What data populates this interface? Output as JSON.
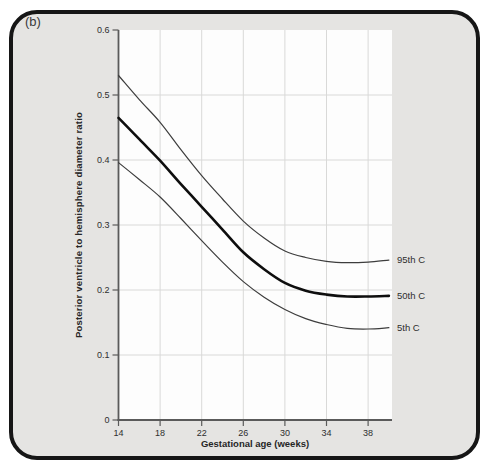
{
  "figure_label": "(b)",
  "colors": {
    "card_background": "#e5e4e2",
    "card_border": "#161616",
    "plot_background": "#fdfdfd",
    "gridline": "#d9d9d8",
    "axis": "#5a5a5a",
    "curve_thin": "#3d3d3d",
    "curve_thick": "#0e0e0e",
    "text": "#2e2e2e"
  },
  "chart_data": {
    "type": "line",
    "title": "",
    "xlabel": "Gestational age (weeks)",
    "ylabel": "Posterior ventricle to hemisphere diameter ratio",
    "xlim": [
      14,
      40.3
    ],
    "ylim": [
      0,
      0.6
    ],
    "xticks": [
      14,
      18,
      22,
      26,
      30,
      34,
      38
    ],
    "yticks": [
      0,
      0.1,
      0.2,
      0.3,
      0.4,
      0.5,
      0.6
    ],
    "grid": true,
    "legend_position": "labels-right-of-curves",
    "x": [
      14,
      16,
      18,
      20,
      22,
      24,
      26,
      28,
      30,
      32,
      34,
      36,
      38,
      40
    ],
    "series": [
      {
        "name": "95th C",
        "thick": false,
        "values": [
          0.53,
          0.493,
          0.458,
          0.416,
          0.376,
          0.34,
          0.306,
          0.28,
          0.26,
          0.25,
          0.244,
          0.242,
          0.243,
          0.246
        ]
      },
      {
        "name": "50th C",
        "thick": true,
        "values": [
          0.465,
          0.432,
          0.399,
          0.363,
          0.328,
          0.293,
          0.258,
          0.232,
          0.211,
          0.199,
          0.193,
          0.19,
          0.19,
          0.191
        ]
      },
      {
        "name": "5th C",
        "thick": false,
        "values": [
          0.396,
          0.37,
          0.343,
          0.31,
          0.276,
          0.243,
          0.213,
          0.189,
          0.17,
          0.156,
          0.147,
          0.141,
          0.14,
          0.142
        ]
      }
    ]
  }
}
